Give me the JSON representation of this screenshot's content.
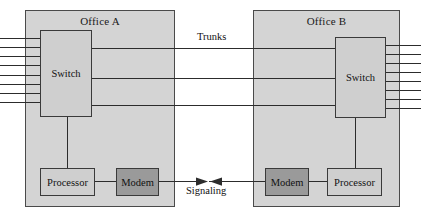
{
  "diagram": {
    "offices": [
      {
        "id": "office-a",
        "label": "Office A",
        "switch_label": "Switch",
        "processor_label": "Processor",
        "modem_label": "Modem",
        "subscriber_line_count": 8,
        "subscriber_line_side": "left"
      },
      {
        "id": "office-b",
        "label": "Office B",
        "switch_label": "Switch",
        "processor_label": "Processor",
        "modem_label": "Modem",
        "subscriber_line_count": 8,
        "subscriber_line_side": "right"
      }
    ],
    "links": {
      "trunks_label": "Trunks",
      "trunk_count": 3,
      "signaling_label": "Signaling",
      "signaling_direction": "bidirectional"
    },
    "colors": {
      "office_fill": "#d4d4d4",
      "node_light_fill": "#cfcfcf",
      "node_dark_fill": "#9a9a9a",
      "line_color": "#2c2c2c",
      "border_color": "#3a3a3a",
      "page_background": "#ffffff"
    }
  }
}
